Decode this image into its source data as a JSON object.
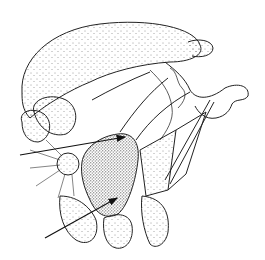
{
  "figure": {
    "background_color": "#ffffff",
    "ink_color": "#222222",
    "arrows": [
      {
        "name": "upper-arrow",
        "from": [
          20,
          155
        ],
        "to": [
          125,
          137
        ]
      },
      {
        "name": "lower-arrow",
        "from": [
          45,
          238
        ],
        "to": [
          117,
          198
        ]
      }
    ]
  }
}
